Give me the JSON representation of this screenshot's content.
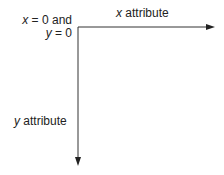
{
  "diagram": {
    "origin_label": {
      "line1_var": "x",
      "line1_rest": " = 0 and",
      "line2_var": "y",
      "line2_rest": " = 0"
    },
    "x_axis_label": {
      "var": "x",
      "rest": " attribute"
    },
    "y_axis_label": {
      "var": "y",
      "rest": " attribute"
    },
    "axis_color": "#333333"
  }
}
